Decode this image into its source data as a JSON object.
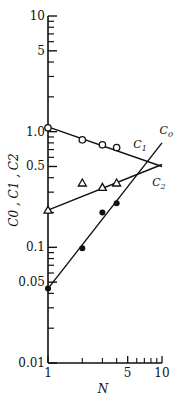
{
  "chart_data": {
    "type": "scatter",
    "title": "",
    "xlabel": "N",
    "ylabel": "C0, C1, C2",
    "xscale": "log",
    "yscale": "log",
    "xlim": [
      1,
      10
    ],
    "ylim": [
      0.01,
      10
    ],
    "grid": false,
    "x_ticks": [
      {
        "value": 1,
        "label": "1"
      },
      {
        "value": 5,
        "label": "5"
      },
      {
        "value": 10,
        "label": "10"
      }
    ],
    "x_minor_ticks": [
      2,
      3,
      4,
      6,
      7,
      8,
      9
    ],
    "y_ticks": [
      {
        "value": 0.01,
        "label": "0.01"
      },
      {
        "value": 0.05,
        "label": "0.05"
      },
      {
        "value": 0.1,
        "label": "0.1"
      },
      {
        "value": 0.5,
        "label": "0.5"
      },
      {
        "value": 1.0,
        "label": "1.0"
      },
      {
        "value": 5,
        "label": "5"
      },
      {
        "value": 10,
        "label": "10"
      }
    ],
    "y_minor_ticks": [
      0.02,
      0.03,
      0.04,
      0.06,
      0.07,
      0.08,
      0.09,
      0.2,
      0.3,
      0.4,
      0.6,
      0.7,
      0.8,
      0.9,
      2,
      3,
      4,
      6,
      7,
      8,
      9
    ],
    "series": [
      {
        "name": "C0",
        "marker": "filled-circle",
        "x": [
          1,
          2,
          3,
          4
        ],
        "values": [
          0.044,
          0.098,
          0.2,
          0.24
        ],
        "fit_line": {
          "x": [
            1,
            10
          ],
          "y": [
            0.044,
            0.8
          ]
        },
        "label_at": {
          "x": 9.5,
          "y": 0.95
        }
      },
      {
        "name": "C1",
        "marker": "open-circle",
        "x": [
          1,
          2,
          3,
          4
        ],
        "values": [
          1.08,
          0.85,
          0.77,
          0.73
        ],
        "fit_line": {
          "x": [
            1,
            10
          ],
          "y": [
            1.1,
            0.5
          ]
        },
        "label_at": {
          "x": 5.6,
          "y": 0.72
        }
      },
      {
        "name": "C2",
        "marker": "open-triangle",
        "x": [
          1,
          2,
          3,
          4
        ],
        "values": [
          0.21,
          0.36,
          0.33,
          0.36
        ],
        "fit_line": {
          "x": [
            1,
            10
          ],
          "y": [
            0.21,
            0.52
          ]
        },
        "label_at": {
          "x": 8.2,
          "y": 0.34
        }
      }
    ]
  },
  "labels": {
    "series_c0": "C",
    "series_c0_sub": "0",
    "series_c1": "C",
    "series_c1_sub": "1",
    "series_c2": "C",
    "series_c2_sub": "2",
    "ylabel_text": "C0 , C1 , C2",
    "xlabel_text": "N"
  }
}
